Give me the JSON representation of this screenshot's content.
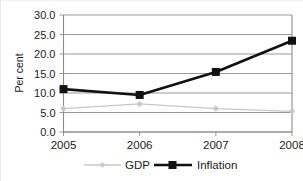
{
  "chart_data": {
    "type": "line",
    "title": "",
    "xlabel": "",
    "ylabel": "Per cent",
    "categories": [
      "2005",
      "2006",
      "2007",
      "2008"
    ],
    "ylim": [
      0.0,
      30.0
    ],
    "yticks": [
      "0.0",
      "5.0",
      "10.0",
      "15.0",
      "20.0",
      "25.0",
      "30.0"
    ],
    "ytick_values": [
      0.0,
      5.0,
      10.0,
      15.0,
      20.0,
      25.0,
      30.0
    ],
    "grid": true,
    "legend_position": "bottom-center",
    "series": [
      {
        "name": "GDP",
        "values": [
          6.0,
          7.2,
          6.0,
          5.3
        ],
        "color": "#c8c8c8",
        "marker": "diamond",
        "line_width": 1.4
      },
      {
        "name": "Inflation",
        "values": [
          11.0,
          9.5,
          15.4,
          23.4
        ],
        "color": "#111111",
        "marker": "square",
        "line_width": 2.6
      }
    ]
  },
  "legend": {
    "items": [
      {
        "label": "GDP"
      },
      {
        "label": "Inflation"
      }
    ]
  },
  "axes": {
    "y_title": "Per cent"
  }
}
